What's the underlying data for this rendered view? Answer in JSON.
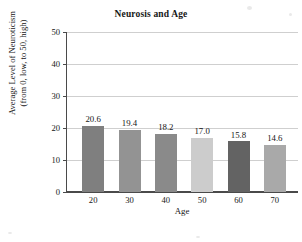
{
  "chart_data": {
    "type": "bar",
    "title": "Neurosis and Age",
    "xlabel": "Age",
    "ylabel": "Average Level of Neuroticism (from 0, low, to 50, high)",
    "ylabel_lines": [
      "Average Level of Neuroticism",
      "(from 0, low, to 50, high)"
    ],
    "categories": [
      "20",
      "30",
      "40",
      "50",
      "60",
      "70"
    ],
    "values": [
      20.6,
      19.4,
      18.2,
      17.0,
      15.8,
      14.6
    ],
    "value_labels": [
      "20.6",
      "19.4",
      "18.2",
      "17.0",
      "15.8",
      "14.6"
    ],
    "bar_colors": [
      "#7f7f7f",
      "#939393",
      "#8a8a8a",
      "#cccccc",
      "#636363",
      "#a9a9a9"
    ],
    "ylim": [
      0,
      50
    ],
    "yticks": [
      0,
      10,
      20,
      30,
      40,
      50
    ],
    "ytick_labels": [
      "0",
      "10",
      "20",
      "30",
      "40",
      "50"
    ],
    "grid": true,
    "grid_color": "#cfcfcf",
    "axis_color": "#4a4a4a",
    "legend": null,
    "legend_position": "none",
    "background": "#ffffff"
  }
}
